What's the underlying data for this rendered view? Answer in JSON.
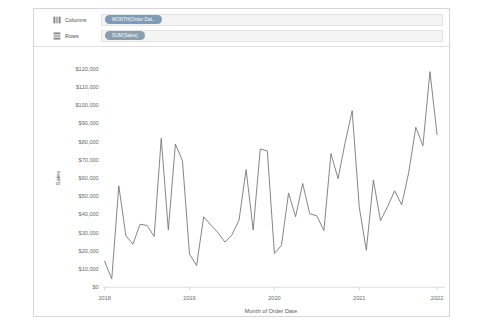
{
  "card": {
    "columns_shelf": {
      "label": "Columns",
      "icon": "columns-grid-icon",
      "pill": {
        "text": "MONTH(Order Dat..",
        "kind": "dimension",
        "color": "#7f9bb5"
      }
    },
    "rows_shelf": {
      "label": "Rows",
      "icon": "rows-grid-icon",
      "pill": {
        "text": "SUM(Sales)",
        "kind": "measure",
        "color": "#8a9fae"
      }
    }
  },
  "chart_data": {
    "type": "line",
    "title": "",
    "xlabel": "Month of Order Date",
    "ylabel": "Sales",
    "grid": false,
    "legend": "none",
    "line_color": "#6f6f6f",
    "ylim": [
      0,
      120000
    ],
    "ytick_labels": [
      "$120,000",
      "$110,000",
      "$100,000",
      "$90,000",
      "$80,000",
      "$70,000",
      "$60,000",
      "$50,000",
      "$40,000",
      "$30,000",
      "$20,000",
      "$10,000",
      "$0"
    ],
    "ytick_values": [
      120000,
      110000,
      100000,
      90000,
      80000,
      70000,
      60000,
      50000,
      40000,
      30000,
      20000,
      10000,
      0
    ],
    "xtick_labels": [
      "2018",
      "2019",
      "2020",
      "2021",
      "2022"
    ],
    "xtick_values": [
      "2018-01",
      "2019-01",
      "2020-01",
      "2021-01",
      "2022-01"
    ],
    "xlim": [
      "2018-01",
      "2022-01"
    ],
    "x": [
      "2018-01",
      "2018-02",
      "2018-03",
      "2018-04",
      "2018-05",
      "2018-06",
      "2018-07",
      "2018-08",
      "2018-09",
      "2018-10",
      "2018-11",
      "2018-12",
      "2019-01",
      "2019-02",
      "2019-03",
      "2019-04",
      "2019-05",
      "2019-06",
      "2019-07",
      "2019-08",
      "2019-09",
      "2019-10",
      "2019-11",
      "2019-12",
      "2020-01",
      "2020-02",
      "2020-03",
      "2020-04",
      "2020-05",
      "2020-06",
      "2020-07",
      "2020-08",
      "2020-09",
      "2020-10",
      "2020-11",
      "2020-12",
      "2021-01",
      "2021-02",
      "2021-03",
      "2021-04",
      "2021-05",
      "2021-06",
      "2021-07",
      "2021-08",
      "2021-09",
      "2021-10",
      "2021-11",
      "2021-12"
    ],
    "values": [
      14236,
      4520,
      55691,
      28295,
      23648,
      34595,
      33946,
      27909,
      81777,
      31453,
      78629,
      69545,
      18174,
      11951,
      38726,
      34195,
      30132,
      24797,
      28765,
      36898,
      64595,
      31404,
      75972,
      74919,
      18542,
      22979,
      51715,
      38750,
      56987,
      40344,
      39262,
      31116,
      73410,
      59687,
      79412,
      96999,
      43971,
      20301,
      58872,
      36522,
      44261,
      52982,
      45264,
      63121,
      87866,
      77777,
      118448,
      83829
    ]
  }
}
